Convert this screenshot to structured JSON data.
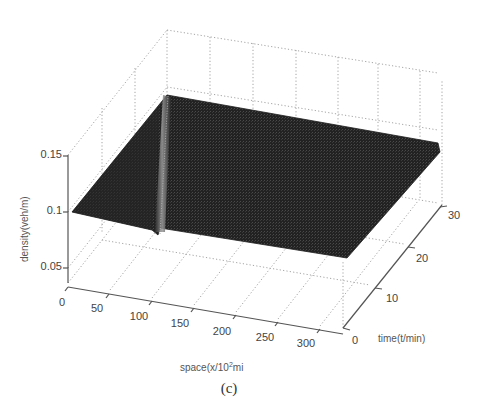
{
  "chart_data": {
    "type": "surface3d",
    "title": "",
    "caption": "(c)",
    "xlabel": "space(x/10²mi",
    "ylabel": "time(t/min)",
    "zlabel": "density(veh/m)",
    "x_ticks": [
      "0",
      "50",
      "100",
      "150",
      "200",
      "250",
      "300"
    ],
    "y_ticks": [
      "0",
      "10",
      "20",
      "30"
    ],
    "z_ticks": [
      "0.05",
      "0.1",
      "0.15"
    ],
    "xlim": [
      0,
      330
    ],
    "ylim": [
      0,
      30
    ],
    "zlim": [
      0.04,
      0.15
    ],
    "grid": true,
    "surface": {
      "description": "Nearly flat density surface at ~0.1 veh/m over all space and time, with a narrow ridge (shock/discontinuity line) near x≈100 spanning the full time range",
      "base_density": 0.1,
      "ridge_x": 100,
      "ridge_time_range": [
        0,
        30
      ],
      "color": "#2a2a2a"
    }
  },
  "labels": {
    "caption": "(c)",
    "space_axis": "space(x/10",
    "space_axis_sup": "2",
    "space_axis_tail": "mi",
    "time_axis": "time(t/min)",
    "density_axis": "density(veh/m)"
  },
  "ticks": {
    "z": [
      {
        "label": "0.15",
        "x": 62,
        "y": 158
      },
      {
        "label": "0.1",
        "x": 62,
        "y": 214
      },
      {
        "label": "0.05",
        "x": 62,
        "y": 270
      }
    ],
    "x": [
      {
        "label": "0",
        "x": 62,
        "y": 306
      },
      {
        "label": "50",
        "x": 97,
        "y": 312
      },
      {
        "label": "100",
        "x": 139,
        "y": 320
      },
      {
        "label": "150",
        "x": 180,
        "y": 327
      },
      {
        "label": "200",
        "x": 222,
        "y": 335
      },
      {
        "label": "250",
        "x": 265,
        "y": 341
      },
      {
        "label": "300",
        "x": 306,
        "y": 347
      }
    ],
    "y": [
      {
        "label": "0",
        "x": 352,
        "y": 344
      },
      {
        "label": "10",
        "x": 386,
        "y": 302
      },
      {
        "label": "20",
        "x": 416,
        "y": 262
      },
      {
        "label": "30",
        "x": 448,
        "y": 219
      }
    ]
  },
  "colors": {
    "surface": "#262626",
    "ridge": "#8c8c8c",
    "grid": "#9a9a9a",
    "axis": "#555555",
    "text": "#444444"
  }
}
